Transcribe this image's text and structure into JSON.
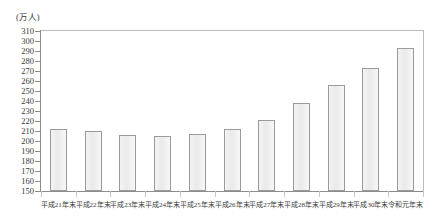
{
  "chart_data": {
    "type": "bar",
    "title": "",
    "subtitle": "",
    "unit_label": "(万人)",
    "xlabel": "",
    "ylabel": "",
    "ylim": [
      150,
      310
    ],
    "y_tick_step": 10,
    "y_ticks": [
      150,
      160,
      170,
      180,
      190,
      200,
      210,
      220,
      230,
      240,
      250,
      260,
      270,
      280,
      290,
      300,
      310
    ],
    "grid": false,
    "legend": "none",
    "categories": [
      "平成21年末",
      "平成22年末",
      "平成23年末",
      "平成24年末",
      "平成25年末",
      "平成26年末",
      "平成27年末",
      "平成28年末",
      "平成29年末",
      "平成30年末",
      "令和元年末"
    ],
    "values": [
      212,
      210,
      206,
      205,
      207,
      212,
      221,
      238,
      256,
      273,
      293
    ],
    "series": [
      {
        "name": "",
        "values": [
          212,
          210,
          206,
          205,
          207,
          212,
          221,
          238,
          256,
          273,
          293
        ]
      }
    ],
    "colors": {
      "bar_fill": "#eeeeee",
      "bar_border": "#9a9a9a",
      "axis": "#8c8c8c",
      "text": "#3a3a3a"
    }
  }
}
